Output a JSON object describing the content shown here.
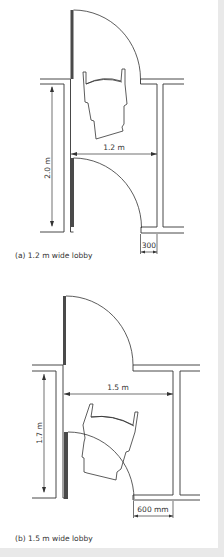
{
  "figure": {
    "diagram_a": {
      "caption": "(a) 1.2 m wide lobby",
      "dimensions": {
        "length": "2.0 m",
        "width": "1.2 m",
        "offset": "300"
      }
    },
    "diagram_b": {
      "caption": "(b) 1.5 m wide lobby",
      "dimensions": {
        "length": "1.7 m",
        "width": "1.5 m",
        "offset": "600 mm"
      }
    }
  },
  "colors": {
    "background": "#ffffff",
    "outer_background": "#e9e9e9",
    "line": "#333333",
    "door_leaf": "#4a4a4a"
  }
}
